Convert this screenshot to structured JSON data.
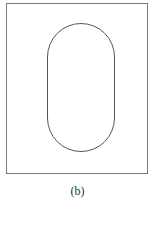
{
  "figure": {
    "caption": "(b)",
    "frame": {
      "shape": "rectangle",
      "stroke": "#7a7a7a"
    },
    "inner_shape": {
      "shape": "stadium",
      "orientation": "vertical",
      "stroke": "#555555"
    }
  }
}
